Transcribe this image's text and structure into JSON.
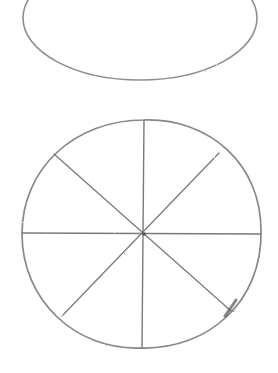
{
  "drawing": {
    "style": "pencil sketch",
    "stroke_color": "#7a7a7a",
    "background": "#ffffff",
    "shapes": [
      {
        "name": "ellipse",
        "cx": 140,
        "cy": 18,
        "rx": 117,
        "ry": 62
      },
      {
        "name": "circle-divided-into-eight",
        "cx": 144,
        "cy": 234,
        "rx": 120,
        "ry": 114,
        "segments": 8
      }
    ]
  }
}
